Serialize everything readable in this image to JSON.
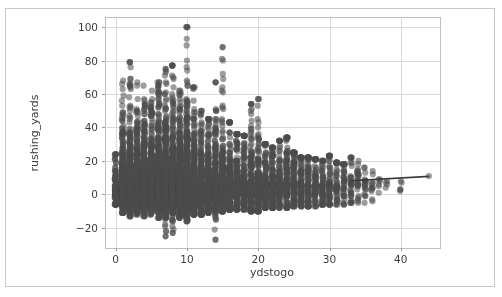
{
  "chart_data": {
    "type": "scatter",
    "title": "",
    "xlabel": "ydstogo",
    "ylabel": "rushing_yards",
    "xlim": [
      -1.5,
      45.5
    ],
    "ylim": [
      -32,
      106
    ],
    "xticks": [
      0,
      10,
      20,
      30,
      40
    ],
    "yticks": [
      -20,
      0,
      20,
      40,
      60,
      80,
      100
    ],
    "xtick_labels": [
      "0",
      "10",
      "20",
      "30",
      "40"
    ],
    "ytick_labels": [
      "−20",
      "0",
      "20",
      "40",
      "60",
      "80",
      "100"
    ],
    "grid": true,
    "legend": null,
    "marker_color": "#4d4d4d",
    "marker_alpha": 0.55,
    "marker_size": 3.1,
    "line_color": "#3a3a3a",
    "regression_line": {
      "x": [
        33.0,
        44.0
      ],
      "y": [
        8.2,
        10.8
      ],
      "note": "fitted trend segment at high ydstogo"
    },
    "series_name": "plays",
    "columns": [
      {
        "x": 0,
        "n": 120,
        "min": -6,
        "max": 24,
        "median": 2,
        "q1": 0,
        "q3": 5
      },
      {
        "x": 1,
        "n": 900,
        "min": -11,
        "max": 70,
        "median": 2,
        "q1": 0,
        "q3": 5
      },
      {
        "x": 2,
        "n": 880,
        "min": -13,
        "max": 79,
        "median": 3,
        "q1": 0,
        "q3": 6
      },
      {
        "x": 3,
        "n": 870,
        "min": -12,
        "max": 67,
        "median": 3,
        "q1": 1,
        "q3": 7
      },
      {
        "x": 4,
        "n": 860,
        "min": -13,
        "max": 68,
        "median": 3,
        "q1": 1,
        "q3": 7
      },
      {
        "x": 5,
        "n": 850,
        "min": -12,
        "max": 62,
        "median": 3,
        "q1": 1,
        "q3": 7
      },
      {
        "x": 6,
        "n": 840,
        "min": -14,
        "max": 67,
        "median": 4,
        "q1": 1,
        "q3": 8
      },
      {
        "x": 7,
        "n": 830,
        "min": -25,
        "max": 75,
        "median": 4,
        "q1": 1,
        "q3": 8
      },
      {
        "x": 8,
        "n": 820,
        "min": -23,
        "max": 77,
        "median": 4,
        "q1": 1,
        "q3": 8
      },
      {
        "x": 9,
        "n": 800,
        "min": -14,
        "max": 62,
        "median": 4,
        "q1": 1,
        "q3": 8
      },
      {
        "x": 10,
        "n": 950,
        "min": -16,
        "max": 100,
        "median": 4,
        "q1": 1,
        "q3": 9
      },
      {
        "x": 11,
        "n": 380,
        "min": -12,
        "max": 64,
        "median": 4,
        "q1": 1,
        "q3": 9
      },
      {
        "x": 12,
        "n": 330,
        "min": -12,
        "max": 50,
        "median": 4,
        "q1": 1,
        "q3": 9
      },
      {
        "x": 13,
        "n": 300,
        "min": -11,
        "max": 45,
        "median": 4,
        "q1": 1,
        "q3": 9
      },
      {
        "x": 14,
        "n": 280,
        "min": -27,
        "max": 67,
        "median": 4,
        "q1": 1,
        "q3": 9
      },
      {
        "x": 15,
        "n": 320,
        "min": -10,
        "max": 88,
        "median": 4,
        "q1": 1,
        "q3": 9
      },
      {
        "x": 16,
        "n": 230,
        "min": -9,
        "max": 43,
        "median": 4,
        "q1": 1,
        "q3": 9
      },
      {
        "x": 17,
        "n": 210,
        "min": -9,
        "max": 36,
        "median": 4,
        "q1": 1,
        "q3": 9
      },
      {
        "x": 18,
        "n": 200,
        "min": -9,
        "max": 35,
        "median": 5,
        "q1": 1,
        "q3": 10
      },
      {
        "x": 19,
        "n": 190,
        "min": -10,
        "max": 54,
        "median": 5,
        "q1": 1,
        "q3": 10
      },
      {
        "x": 20,
        "n": 220,
        "min": -10,
        "max": 57,
        "median": 5,
        "q1": 1,
        "q3": 10
      },
      {
        "x": 21,
        "n": 150,
        "min": -8,
        "max": 30,
        "median": 5,
        "q1": 1,
        "q3": 10
      },
      {
        "x": 22,
        "n": 140,
        "min": -8,
        "max": 28,
        "median": 5,
        "q1": 1,
        "q3": 10
      },
      {
        "x": 23,
        "n": 130,
        "min": -8,
        "max": 32,
        "median": 5,
        "q1": 1,
        "q3": 10
      },
      {
        "x": 24,
        "n": 120,
        "min": -8,
        "max": 34,
        "median": 5,
        "q1": 1,
        "q3": 10
      },
      {
        "x": 25,
        "n": 115,
        "min": -7,
        "max": 25,
        "median": 5,
        "q1": 1,
        "q3": 10
      },
      {
        "x": 26,
        "n": 100,
        "min": -7,
        "max": 22,
        "median": 5,
        "q1": 1,
        "q3": 10
      },
      {
        "x": 27,
        "n": 90,
        "min": -7,
        "max": 22,
        "median": 5,
        "q1": 1,
        "q3": 10
      },
      {
        "x": 28,
        "n": 80,
        "min": -7,
        "max": 21,
        "median": 5,
        "q1": 1,
        "q3": 10
      },
      {
        "x": 29,
        "n": 70,
        "min": -6,
        "max": 20,
        "median": 5,
        "q1": 1,
        "q3": 10
      },
      {
        "x": 30,
        "n": 65,
        "min": -6,
        "max": 23,
        "median": 5,
        "q1": 1,
        "q3": 10
      },
      {
        "x": 31,
        "n": 45,
        "min": -6,
        "max": 19,
        "median": 5,
        "q1": 1,
        "q3": 10
      },
      {
        "x": 32,
        "n": 40,
        "min": -6,
        "max": 18,
        "median": 6,
        "q1": 1,
        "q3": 11
      },
      {
        "x": 33,
        "n": 35,
        "min": -5,
        "max": 22,
        "median": 6,
        "q1": 1,
        "q3": 11
      },
      {
        "x": 34,
        "n": 25,
        "min": -5,
        "max": 20,
        "median": 6,
        "q1": 2,
        "q3": 11
      },
      {
        "x": 35,
        "n": 20,
        "min": -5,
        "max": 16,
        "median": 6,
        "q1": 2,
        "q3": 11
      },
      {
        "x": 36,
        "n": 12,
        "min": -4,
        "max": 14,
        "median": 6,
        "q1": 2,
        "q3": 11
      },
      {
        "x": 37,
        "n": 6,
        "min": 0,
        "max": 9,
        "median": 4,
        "q1": 2,
        "q3": 7
      },
      {
        "x": 38,
        "n": 4,
        "min": -1,
        "max": 8,
        "median": 4,
        "q1": 1,
        "q3": 6
      },
      {
        "x": 40,
        "n": 5,
        "min": 2,
        "max": 14,
        "median": 7,
        "q1": 4,
        "q3": 11
      },
      {
        "x": 44,
        "n": 1,
        "min": 11,
        "max": 11,
        "median": 11,
        "q1": 11,
        "q3": 11
      }
    ],
    "notable_outliers": [
      {
        "x": 10,
        "y": 100
      },
      {
        "x": 15,
        "y": 88
      },
      {
        "x": 2,
        "y": 79
      },
      {
        "x": 8,
        "y": 77
      },
      {
        "x": 7,
        "y": 75
      },
      {
        "x": 14,
        "y": 67
      },
      {
        "x": 19,
        "y": 54
      },
      {
        "x": 7,
        "y": -25
      },
      {
        "x": 8,
        "y": -23
      },
      {
        "x": 14,
        "y": -27
      }
    ]
  }
}
